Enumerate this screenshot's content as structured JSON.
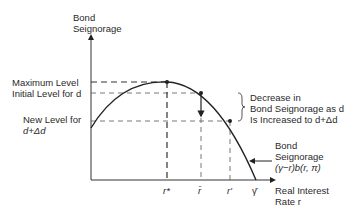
{
  "y_axis": {
    "label_line1": "Bond",
    "label_line2": "Seignorage"
  },
  "x_axis": {
    "label_line1": "Real Interest",
    "label_line2": "Rate r"
  },
  "levels": {
    "maximum": "Maximum Level",
    "initial": "Initial Level for d",
    "new_line1": "New Level for",
    "new_line2": "d+Δd"
  },
  "annotation": {
    "line1": "Decrease in",
    "line2": "Bond Seignorage as d",
    "line3": "Is Increased to d+Δd"
  },
  "curve_label": {
    "line1": "Bond",
    "line2": "Seignorage",
    "line3": "(γ−r)b(r, π)"
  },
  "x_ticks": [
    "r*",
    "r̄",
    "r′",
    "γ̄"
  ]
}
